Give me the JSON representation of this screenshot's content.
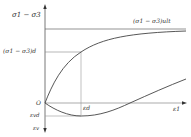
{
  "diagram": {
    "type": "stress-strain curves",
    "axes": {
      "y_label": "σ1 − σ3",
      "x_label": "ε1",
      "x_label_sub": "1",
      "y_down_label": "εv",
      "origin_label": "O"
    },
    "annotations": {
      "ult_label": "(σ1 − σ3)ult",
      "peak_label": "(σ1 − σ3)d",
      "strain_d_label": "εd",
      "vol_d_label": "εvd"
    },
    "colors": {
      "line": "#555555",
      "curve": "#444444",
      "guide": "#888888"
    }
  }
}
